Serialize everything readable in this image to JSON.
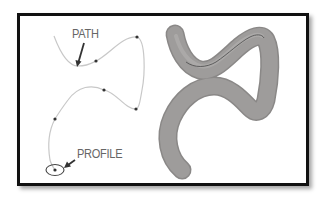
{
  "figure": {
    "type": "sweep-illustration",
    "labels": {
      "path": "PATH",
      "profile": "PROFILE"
    },
    "colors": {
      "frame_border": "#111111",
      "background": "#ffffff",
      "label_text": "#666666",
      "path_curve": "#c8c8c8",
      "control_point": "#333333",
      "arrow": "#333333",
      "tube_fill": "#9e9c9b",
      "tube_edge": "#8a8887",
      "tube_center_line": "#555555"
    },
    "left_panel": {
      "description": "2D path spline with control points and circular profile",
      "control_points": [
        [
          96,
          61
        ],
        [
          137,
          37
        ],
        [
          136,
          109
        ],
        [
          104,
          90
        ],
        [
          55,
          119
        ],
        [
          55,
          170
        ]
      ]
    },
    "right_panel": {
      "description": "3D swept tube solid resulting from profile along path"
    }
  }
}
